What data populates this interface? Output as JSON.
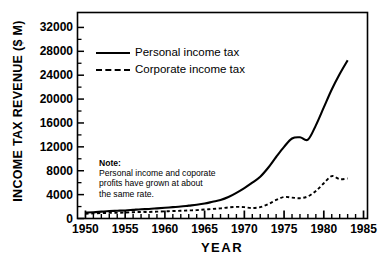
{
  "chart_data": {
    "type": "line",
    "title": "",
    "xlabel": "YEAR",
    "ylabel": "INCOME TAX REVENUE ($ M)",
    "xlim": [
      1949,
      1985.5
    ],
    "ylim": [
      0,
      34500
    ],
    "grid": false,
    "legend_position": "top-left-inside",
    "xticks": [
      1950,
      1955,
      1960,
      1965,
      1970,
      1975,
      1980,
      1985
    ],
    "xtick_labels": [
      "1950",
      "1955",
      "1960",
      "1965",
      "1970",
      "1975",
      "1980",
      "1985"
    ],
    "xminor_tick_step": 1,
    "yticks": [
      0,
      4000,
      8000,
      12000,
      16000,
      20000,
      24000,
      28000,
      32000
    ],
    "ytick_labels": [
      "0",
      "4000",
      "8000",
      "12000",
      "16000",
      "20000",
      "24000",
      "28000",
      "32000"
    ],
    "series": [
      {
        "name": "Personal income tax",
        "style": "solid",
        "color": "#000000",
        "x": [
          1950,
          1951,
          1952,
          1953,
          1954,
          1955,
          1956,
          1957,
          1958,
          1959,
          1960,
          1961,
          1962,
          1963,
          1964,
          1965,
          1966,
          1967,
          1968,
          1969,
          1970,
          1971,
          1972,
          1973,
          1974,
          1975,
          1976,
          1977,
          1978,
          1979,
          1980,
          1981,
          1982,
          1983
        ],
        "values": [
          1000,
          1050,
          1150,
          1250,
          1300,
          1350,
          1450,
          1550,
          1600,
          1700,
          1800,
          1900,
          2000,
          2150,
          2300,
          2500,
          2800,
          3100,
          3600,
          4300,
          5100,
          6000,
          7000,
          8500,
          10300,
          12000,
          13400,
          13600,
          13200,
          15600,
          18600,
          21600,
          24200,
          26500
        ]
      },
      {
        "name": "Corporate income tax",
        "style": "dashed",
        "color": "#000000",
        "x": [
          1950,
          1951,
          1952,
          1953,
          1954,
          1955,
          1956,
          1957,
          1958,
          1959,
          1960,
          1961,
          1962,
          1963,
          1964,
          1965,
          1966,
          1967,
          1968,
          1969,
          1970,
          1971,
          1972,
          1973,
          1974,
          1975,
          1976,
          1977,
          1978,
          1979,
          1980,
          1981,
          1982,
          1983
        ],
        "values": [
          800,
          850,
          900,
          950,
          950,
          1000,
          1050,
          1100,
          1100,
          1150,
          1200,
          1250,
          1300,
          1350,
          1400,
          1500,
          1600,
          1700,
          1850,
          1950,
          1900,
          1750,
          1900,
          2400,
          3100,
          3600,
          3500,
          3400,
          3700,
          4600,
          5900,
          7100,
          6600,
          6700
        ]
      }
    ],
    "annotations": [
      {
        "name": "note",
        "title": "Note:",
        "lines": [
          "Personal income and  coporate",
          "profits have grown at about",
          "the same rate."
        ]
      }
    ]
  },
  "legend": {
    "items": [
      {
        "label": "Personal income tax",
        "style": "solid"
      },
      {
        "label": "Corporate income tax",
        "style": "dashed"
      }
    ]
  }
}
